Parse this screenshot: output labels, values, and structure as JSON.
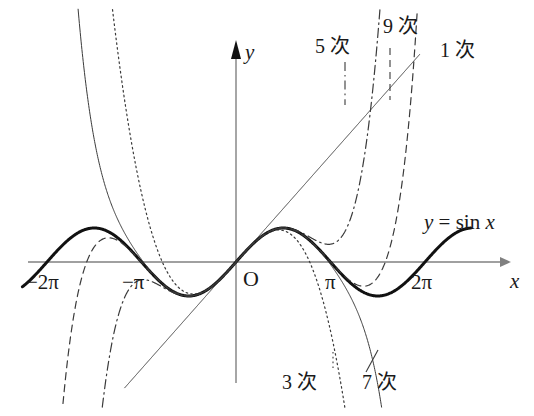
{
  "figure": {
    "background_color": "#ffffff",
    "ink_color": "#1a1a1a",
    "axis_color": "#808080"
  },
  "axes": {
    "y_axis_label": "y",
    "x_axis_label": "x",
    "origin_label": "O",
    "x_ticks": [
      {
        "label": "−2π",
        "value": -6.2832
      },
      {
        "label": "−π",
        "value": -3.1416
      },
      {
        "label": "π",
        "value": 3.1416
      },
      {
        "label": "2π",
        "value": 6.2832
      }
    ]
  },
  "curve_label": {
    "lhs": "y",
    "equals": "=",
    "rhs_fn": "sin",
    "rhs_var": "x",
    "full": "y = sin x"
  },
  "series_labels": [
    {
      "name": "deg1",
      "label": "1 次"
    },
    {
      "name": "deg3",
      "label": "3 次"
    },
    {
      "name": "deg5",
      "label": "5 次"
    },
    {
      "name": "deg7",
      "label": "7 次"
    },
    {
      "name": "deg9",
      "label": "9 次"
    }
  ],
  "chart_data": {
    "type": "line",
    "xlabel": "x",
    "ylabel": "y",
    "xlim": [
      -7.3,
      8.0
    ],
    "ylim": [
      -4.4,
      4.9
    ],
    "grid": false,
    "legend": "inline-annotations",
    "x_tick_labels": [
      "−2π",
      "−π",
      "π",
      "2π"
    ],
    "x_tick_values": [
      -6.2832,
      -3.1416,
      3.1416,
      6.2832
    ],
    "series": [
      {
        "name": "y = sin x",
        "annotation": "y = sin x",
        "style": "solid",
        "width": 3.0,
        "color": "#111111",
        "formula": "sin(x)",
        "domain": [
          -7.1,
          7.8
        ]
      },
      {
        "name": "1 次",
        "annotation": "1 次",
        "style": "solid",
        "width": 1.0,
        "color": "#3a3a3a",
        "formula": "x",
        "domain": [
          -3.7,
          6.1
        ]
      },
      {
        "name": "3 次",
        "annotation": "3 次",
        "style": "dotted",
        "width": 1.2,
        "color": "#3a3a3a",
        "formula": "x - x^3/6",
        "domain": [
          -4.55,
          4.55
        ]
      },
      {
        "name": "5 次",
        "annotation": "5 次",
        "style": "dashdot",
        "width": 1.2,
        "color": "#3a3a3a",
        "formula": "x - x^3/6 + x^5/120",
        "domain": [
          -5.45,
          5.45
        ]
      },
      {
        "name": "7 次",
        "annotation": "7 次",
        "style": "solid",
        "width": 1.0,
        "color": "#3a3a3a",
        "formula": "x - x^3/6 + x^5/120 - x^7/5040",
        "domain": [
          -6.35,
          6.35
        ]
      },
      {
        "name": "9 次",
        "annotation": "9 次",
        "style": "dashed",
        "width": 1.2,
        "color": "#3a3a3a",
        "formula": "x - x^3/6 + x^5/120 - x^7/5040 + x^9/362880",
        "domain": [
          -7.15,
          7.15
        ]
      }
    ]
  }
}
